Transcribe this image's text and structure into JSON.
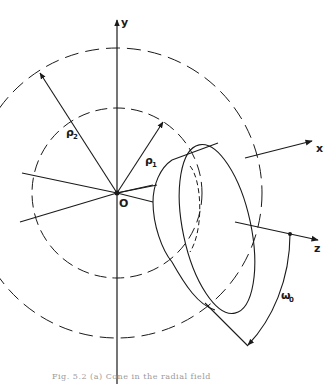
{
  "figure": {
    "axes": {
      "y": "y",
      "x": "x",
      "z": "z",
      "origin": "O"
    },
    "radii": {
      "rho1": "ρ",
      "rho1_sub": "1",
      "rho2": "ρ",
      "rho2_sub": "2"
    },
    "angle": {
      "symbol": "ω",
      "sub": "0"
    },
    "caption": "Fig. 5.2 (a)   Cone in the radial field"
  },
  "colors": {
    "ink": "#1a1a1a",
    "background": "#ffffff"
  }
}
